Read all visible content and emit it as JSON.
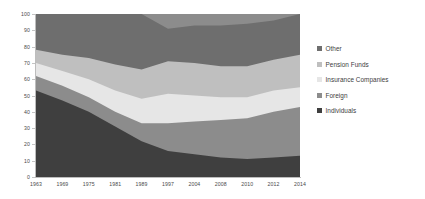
{
  "chart_data": {
    "type": "area",
    "stacked": true,
    "title": "",
    "subtitle": "",
    "xlabel": "",
    "ylabel": "",
    "grid": false,
    "legend_position": "right",
    "xlim_categories": [
      "1963",
      "1969",
      "1975",
      "1981",
      "1989",
      "1997",
      "2004",
      "2008",
      "2010",
      "2012",
      "2014"
    ],
    "categories": [
      "1963",
      "1969",
      "1975",
      "1981",
      "1989",
      "1997",
      "2004",
      "2008",
      "2010",
      "2012",
      "2014"
    ],
    "ylim": [
      0,
      100
    ],
    "yticks": [
      "0",
      "10",
      "20",
      "30",
      "40",
      "50",
      "60",
      "70",
      "80",
      "90",
      "100"
    ],
    "series": [
      {
        "name": "Individuals",
        "color": "#3f3f3f",
        "values": [
          53,
          47,
          40,
          31,
          22,
          16,
          14,
          12,
          11,
          12,
          13
        ]
      },
      {
        "name": "Foreign",
        "color": "#8c8c8c",
        "values": [
          9,
          9,
          9,
          9,
          11,
          17,
          20,
          23,
          25,
          28,
          30
        ]
      },
      {
        "name": "Insurance Companies",
        "color": "#e6e6e6",
        "values": [
          8,
          9,
          11,
          13,
          15,
          18,
          16,
          14,
          13,
          13,
          12
        ]
      },
      {
        "name": "Pension Funds",
        "color": "#bfbfbf",
        "values": [
          8,
          10,
          13,
          16,
          18,
          20,
          20,
          19,
          19,
          19,
          20
        ]
      },
      {
        "name": "Other",
        "color": "#6e6e6e",
        "values": [
          22,
          25,
          27,
          31,
          34,
          20,
          23,
          25,
          26,
          24,
          25
        ]
      }
    ],
    "stack_order_bottom_to_top": [
      "Individuals",
      "Foreign",
      "Insurance Companies",
      "Pension Funds",
      "Other"
    ],
    "stack_tops": {
      "Individuals": [
        53,
        47,
        40,
        31,
        22,
        16,
        14,
        12,
        11,
        12,
        13
      ],
      "Foreign": [
        62,
        56,
        49,
        40,
        33,
        33,
        34,
        35,
        36,
        40,
        43
      ],
      "Insurance Companies": [
        70,
        65,
        60,
        53,
        48,
        51,
        50,
        49,
        49,
        53,
        55
      ],
      "Pension Funds": [
        78,
        75,
        73,
        69,
        66,
        71,
        70,
        68,
        68,
        72,
        75
      ],
      "Other": [
        100,
        100,
        100,
        100,
        100,
        91,
        93,
        93,
        94,
        96,
        100
      ]
    }
  },
  "legend": {
    "items": [
      {
        "label": "Other",
        "color": "#6e6e6e"
      },
      {
        "label": "Pension Funds",
        "color": "#bfbfbf"
      },
      {
        "label": "Insurance Companies",
        "color": "#e6e6e6"
      },
      {
        "label": "Foreign",
        "color": "#8c8c8c"
      },
      {
        "label": "Individuals",
        "color": "#3f3f3f"
      }
    ]
  },
  "axes": {
    "y_ticks": [
      "100",
      "90",
      "80",
      "70",
      "60",
      "50",
      "40",
      "30",
      "20",
      "10",
      "0"
    ],
    "x_ticks": [
      "1963",
      "1969",
      "1975",
      "1981",
      "1989",
      "1997",
      "2004",
      "2008",
      "2010",
      "2012",
      "2014"
    ]
  }
}
